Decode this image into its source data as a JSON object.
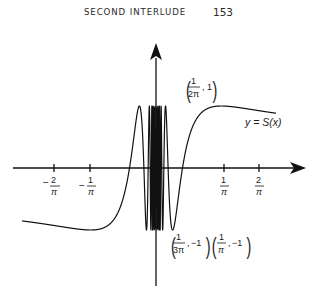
{
  "running_head": {
    "title": "SECOND INTERLUDE",
    "page_number": "153"
  },
  "chart_data": {
    "type": "line",
    "title": "",
    "function_label": "y = S(x)",
    "xlabel": "",
    "ylabel": "",
    "grid": false,
    "legend": "none",
    "x_ticks": [
      {
        "label_num": "2",
        "label_den": "π",
        "sign": "-",
        "value": "-2/π"
      },
      {
        "label_num": "1",
        "label_den": "π",
        "sign": "-",
        "value": "-1/π"
      },
      {
        "label_num": "1",
        "label_den": "π",
        "sign": "",
        "value": "1/π"
      },
      {
        "label_num": "2",
        "label_den": "π",
        "sign": "",
        "value": "2/π"
      }
    ],
    "annotations": [
      {
        "text_num": "1",
        "text_den": "2π",
        "y": "1",
        "point": "(1/(2π), 1)"
      },
      {
        "text_num": "1",
        "text_den": "3π",
        "y": "−1",
        "point": "(1/(3π), −1)"
      },
      {
        "text_num": "1",
        "text_den": "π",
        "y": "−1",
        "point": "(1/π, −1)"
      }
    ],
    "ylim": [
      -1,
      1
    ],
    "colors": {
      "curve": "#111111",
      "axes": "#111111",
      "text": "#1a1a1a"
    }
  }
}
